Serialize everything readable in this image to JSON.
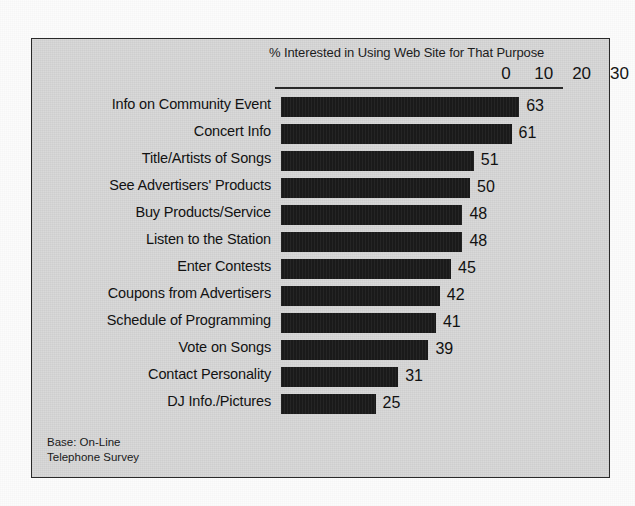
{
  "chart_data": {
    "type": "bar",
    "orientation": "horizontal",
    "title": "% Interested in Using Web Site for That Purpose",
    "xlabel": "",
    "ylabel": "",
    "xlim": [
      0,
      70
    ],
    "xticks": [
      0,
      10,
      20,
      30,
      40,
      50,
      60,
      70
    ],
    "grid": false,
    "legend": null,
    "categories": [
      "Info on Community Event",
      "Concert Info",
      "Title/Artists of Songs",
      "See Advertisers' Products",
      "Buy Products/Service",
      "Listen to the Station",
      "Enter Contests",
      "Coupons from Advertisers",
      "Schedule of Programming",
      "Vote on Songs",
      "Contact Personality",
      "DJ Info./Pictures"
    ],
    "values": [
      63,
      61,
      51,
      50,
      48,
      48,
      45,
      42,
      41,
      39,
      31,
      25
    ],
    "bar_color": "#1b1b1b",
    "annotations": [
      "Base: On-Line",
      "Telephone Survey"
    ]
  },
  "footnote": {
    "line1": "Base: On-Line",
    "line2": "Telephone Survey"
  }
}
